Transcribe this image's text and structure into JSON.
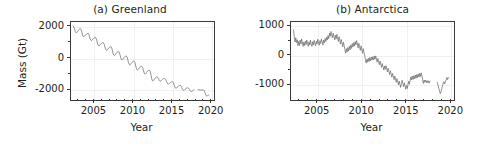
{
  "figure": {
    "background_color": "#ffffff",
    "line_color": "#6e6e6e",
    "frame_color": "#3a3a3a",
    "grid_color": "#f0f0f2"
  },
  "chart_data": [
    {
      "type": "line",
      "title": "(a) Greenland",
      "xlabel": "Year",
      "ylabel": "Mass (Gt)",
      "xlim": [
        2002.0,
        2020.3
      ],
      "ylim": [
        -2600,
        2300
      ],
      "xticks": [
        2005,
        2010,
        2015,
        2020
      ],
      "xtick_labels": [
        "2005",
        "2010",
        "2015",
        "2020"
      ],
      "xticks_minor": [
        2003,
        2004,
        2006,
        2007,
        2008,
        2009,
        2011,
        2012,
        2013,
        2014,
        2016,
        2017,
        2018,
        2019
      ],
      "yticks": [
        2000,
        0,
        -2000
      ],
      "ytick_labels": [
        "2000",
        "0",
        "-2000"
      ],
      "yticks_minor": [
        1000,
        -1000
      ],
      "grid": true,
      "legend": "none",
      "series": [
        {
          "name": "Greenland ice mass anomaly",
          "x": [
            2002.29,
            2002.46,
            2002.54,
            2002.63,
            2002.71,
            2002.79,
            2002.88,
            2002.96,
            2003.04,
            2003.13,
            2003.21,
            2003.29,
            2003.38,
            2003.46,
            2003.54,
            2003.63,
            2003.71,
            2003.79,
            2003.88,
            2003.96,
            2004.04,
            2004.13,
            2004.21,
            2004.29,
            2004.38,
            2004.46,
            2004.54,
            2004.63,
            2004.71,
            2004.79,
            2004.88,
            2004.96,
            2005.04,
            2005.13,
            2005.21,
            2005.29,
            2005.38,
            2005.46,
            2005.54,
            2005.63,
            2005.71,
            2005.79,
            2005.88,
            2005.96,
            2006.04,
            2006.13,
            2006.21,
            2006.29,
            2006.38,
            2006.46,
            2006.54,
            2006.63,
            2006.71,
            2006.79,
            2006.88,
            2006.96,
            2007.04,
            2007.13,
            2007.21,
            2007.29,
            2007.38,
            2007.46,
            2007.54,
            2007.63,
            2007.71,
            2007.79,
            2007.88,
            2007.96,
            2008.04,
            2008.13,
            2008.21,
            2008.29,
            2008.38,
            2008.46,
            2008.54,
            2008.63,
            2008.71,
            2008.79,
            2008.88,
            2008.96,
            2009.04,
            2009.13,
            2009.21,
            2009.29,
            2009.38,
            2009.46,
            2009.54,
            2009.63,
            2009.71,
            2009.79,
            2009.88,
            2009.96,
            2010.04,
            2010.13,
            2010.21,
            2010.29,
            2010.38,
            2010.46,
            2010.54,
            2010.63,
            2010.71,
            2010.79,
            2010.88,
            2010.96,
            2011.04,
            2011.13,
            2011.21,
            2011.29,
            2011.38,
            2011.46,
            2011.54,
            2011.63,
            2011.71,
            2011.79,
            2011.88,
            2011.96,
            2012.04,
            2012.13,
            2012.21,
            2012.29,
            2012.38,
            2012.46,
            2012.54,
            2012.63,
            2012.71,
            2012.79,
            2012.88,
            2012.96,
            2013.04,
            2013.13,
            2013.21,
            2013.29,
            2013.38,
            2013.46,
            2013.54,
            2013.63,
            2013.71,
            2013.79,
            2013.88,
            2013.96,
            2014.04,
            2014.13,
            2014.21,
            2014.29,
            2014.38,
            2014.46,
            2014.54,
            2014.63,
            2014.71,
            2014.79,
            2014.88,
            2014.96,
            2015.04,
            2015.13,
            2015.21,
            2015.29,
            2015.38,
            2015.46,
            2015.54,
            2015.63,
            2015.71,
            2015.79,
            2015.88,
            2015.96,
            2016.04,
            2016.13,
            2016.21,
            2016.29,
            2016.38,
            2016.46,
            2016.54,
            2016.63,
            2016.71,
            2016.79,
            2016.88,
            2016.96,
            2017.04,
            2017.13,
            2017.21,
            2017.29,
            2017.38,
            2017.46,
            2017.54,
            2017.63,
            2017.71,
            2017.79,
            2017.88,
            2017.96,
            2018.5,
            2018.63,
            2018.71,
            2018.79,
            2018.88,
            2018.96,
            2019.04,
            2019.13,
            2019.21,
            2019.29,
            2019.38,
            2019.46,
            2019.54,
            2019.63,
            2019.71,
            2019.79,
            2019.88
          ],
          "y": [
            2050,
            1860,
            1700,
            1620,
            1600,
            1640,
            1700,
            1760,
            1800,
            1860,
            1880,
            1840,
            1700,
            1520,
            1400,
            1350,
            1370,
            1420,
            1470,
            1500,
            1520,
            1560,
            1580,
            1520,
            1400,
            1250,
            1140,
            1100,
            1120,
            1170,
            1220,
            1260,
            1280,
            1300,
            1290,
            1200,
            1040,
            880,
            790,
            760,
            790,
            840,
            890,
            930,
            960,
            980,
            960,
            880,
            740,
            590,
            500,
            470,
            500,
            550,
            610,
            660,
            690,
            710,
            700,
            610,
            440,
            270,
            170,
            140,
            170,
            230,
            290,
            340,
            370,
            390,
            380,
            300,
            150,
            -10,
            -110,
            -140,
            -110,
            -50,
            10,
            60,
            90,
            110,
            100,
            20,
            -140,
            -320,
            -430,
            -470,
            -440,
            -380,
            -320,
            -270,
            -240,
            -220,
            -230,
            -310,
            -470,
            -650,
            -760,
            -800,
            -770,
            -710,
            -650,
            -600,
            -570,
            -550,
            -560,
            -630,
            -770,
            -930,
            -1030,
            -1060,
            -1030,
            -970,
            -910,
            -860,
            -830,
            -810,
            -820,
            -910,
            -1100,
            -1330,
            -1470,
            -1510,
            -1470,
            -1400,
            -1340,
            -1290,
            -1260,
            -1240,
            -1250,
            -1300,
            -1390,
            -1470,
            -1510,
            -1510,
            -1480,
            -1440,
            -1400,
            -1370,
            -1350,
            -1340,
            -1350,
            -1400,
            -1490,
            -1600,
            -1680,
            -1710,
            -1690,
            -1650,
            -1610,
            -1580,
            -1560,
            -1550,
            -1560,
            -1620,
            -1740,
            -1870,
            -1950,
            -1980,
            -1950,
            -1900,
            -1850,
            -1810,
            -1790,
            -1780,
            -1790,
            -1840,
            -1930,
            -2020,
            -2080,
            -2100,
            -2080,
            -2040,
            -2000,
            -1970,
            -1950,
            -1940,
            -1950,
            -1990,
            -2060,
            -2120,
            -2160,
            -2170,
            -2150,
            -2120,
            -2090,
            -2070,
            -2060,
            -2070,
            -2080,
            -2090,
            -2090,
            -2080,
            -2070,
            -2070,
            -2080,
            -2130,
            -2250,
            -2380,
            -2450,
            -2470,
            -2450,
            -2420,
            -2400
          ]
        }
      ]
    },
    {
      "type": "line",
      "title": "(b) Antarctica",
      "xlabel": "Year",
      "ylabel": "",
      "xlim": [
        2002.0,
        2020.3
      ],
      "ylim": [
        -1500,
        1150
      ],
      "xticks": [
        2005,
        2010,
        2015,
        2020
      ],
      "xtick_labels": [
        "2005",
        "2010",
        "2015",
        "2020"
      ],
      "xticks_minor": [
        2003,
        2004,
        2006,
        2007,
        2008,
        2009,
        2011,
        2012,
        2013,
        2014,
        2016,
        2017,
        2018,
        2019
      ],
      "yticks": [
        1000,
        0,
        -1000
      ],
      "ytick_labels": [
        "1000",
        "0",
        "-1000"
      ],
      "yticks_minor": [
        500,
        -500
      ],
      "grid": true,
      "legend": "none",
      "series": [
        {
          "name": "Antarctica ice mass anomaly",
          "x": [
            2002.29,
            2002.38,
            2002.46,
            2002.54,
            2002.63,
            2002.71,
            2002.79,
            2002.88,
            2002.96,
            2003.04,
            2003.13,
            2003.21,
            2003.29,
            2003.38,
            2003.46,
            2003.54,
            2003.63,
            2003.71,
            2003.79,
            2003.88,
            2003.96,
            2004.04,
            2004.13,
            2004.21,
            2004.29,
            2004.38,
            2004.46,
            2004.54,
            2004.63,
            2004.71,
            2004.79,
            2004.88,
            2004.96,
            2005.04,
            2005.13,
            2005.21,
            2005.29,
            2005.38,
            2005.46,
            2005.54,
            2005.63,
            2005.71,
            2005.79,
            2005.88,
            2005.96,
            2006.04,
            2006.13,
            2006.21,
            2006.29,
            2006.38,
            2006.46,
            2006.54,
            2006.63,
            2006.71,
            2006.79,
            2006.88,
            2006.96,
            2007.04,
            2007.13,
            2007.21,
            2007.29,
            2007.38,
            2007.46,
            2007.54,
            2007.63,
            2007.71,
            2007.79,
            2007.88,
            2007.96,
            2008.04,
            2008.13,
            2008.21,
            2008.29,
            2008.38,
            2008.46,
            2008.54,
            2008.63,
            2008.71,
            2008.79,
            2008.88,
            2008.96,
            2009.04,
            2009.13,
            2009.21,
            2009.29,
            2009.38,
            2009.46,
            2009.54,
            2009.63,
            2009.71,
            2009.79,
            2009.88,
            2009.96,
            2010.04,
            2010.13,
            2010.21,
            2010.29,
            2010.38,
            2010.46,
            2010.54,
            2010.63,
            2010.71,
            2010.79,
            2010.88,
            2010.96,
            2011.04,
            2011.13,
            2011.21,
            2011.29,
            2011.38,
            2011.46,
            2011.54,
            2011.63,
            2011.71,
            2011.79,
            2011.88,
            2011.96,
            2012.04,
            2012.13,
            2012.21,
            2012.29,
            2012.38,
            2012.46,
            2012.54,
            2012.63,
            2012.71,
            2012.79,
            2012.88,
            2012.96,
            2013.04,
            2013.13,
            2013.21,
            2013.29,
            2013.38,
            2013.46,
            2013.54,
            2013.63,
            2013.71,
            2013.79,
            2013.88,
            2013.96,
            2014.04,
            2014.13,
            2014.21,
            2014.29,
            2014.38,
            2014.46,
            2014.54,
            2014.63,
            2014.71,
            2014.79,
            2014.88,
            2014.96,
            2015.04,
            2015.13,
            2015.21,
            2015.29,
            2015.38,
            2015.46,
            2015.54,
            2015.63,
            2015.71,
            2015.79,
            2015.88,
            2015.96,
            2016.04,
            2016.13,
            2016.21,
            2016.29,
            2016.38,
            2016.46,
            2016.54,
            2016.63,
            2016.71,
            2016.79,
            2016.88,
            2016.96,
            2017.04,
            2017.13,
            2017.21,
            2017.29,
            2017.38,
            2017.46,
            2017.54,
            2017.63,
            2017.71,
            2017.79,
            2018.63,
            2018.71,
            2018.79,
            2018.88,
            2018.96,
            2019.04,
            2019.13,
            2019.21,
            2019.29,
            2019.38,
            2019.46,
            2019.54,
            2019.63,
            2019.71,
            2019.79,
            2019.88
          ],
          "y": [
            880,
            620,
            450,
            600,
            430,
            530,
            330,
            470,
            330,
            520,
            380,
            560,
            420,
            300,
            450,
            330,
            480,
            360,
            520,
            400,
            300,
            460,
            350,
            520,
            380,
            300,
            460,
            350,
            510,
            400,
            320,
            480,
            380,
            550,
            430,
            340,
            500,
            400,
            560,
            450,
            350,
            520,
            420,
            580,
            470,
            620,
            520,
            680,
            570,
            760,
            650,
            820,
            700,
            600,
            760,
            640,
            520,
            690,
            560,
            720,
            600,
            470,
            640,
            520,
            380,
            540,
            420,
            290,
            450,
            330,
            180,
            60,
            220,
            100,
            260,
            140,
            300,
            180,
            350,
            230,
            400,
            280,
            430,
            310,
            470,
            350,
            500,
            380,
            250,
            410,
            290,
            160,
            320,
            200,
            60,
            220,
            100,
            -40,
            -160,
            -280,
            -140,
            -250,
            -110,
            -230,
            -90,
            -200,
            -70,
            -180,
            -60,
            -170,
            -40,
            -150,
            -30,
            -140,
            -250,
            -120,
            -230,
            -340,
            -210,
            -320,
            -430,
            -300,
            -410,
            -520,
            -390,
            -500,
            -370,
            -480,
            -590,
            -460,
            -570,
            -680,
            -550,
            -660,
            -770,
            -640,
            -750,
            -860,
            -730,
            -840,
            -950,
            -820,
            -930,
            -1040,
            -910,
            -1020,
            -1130,
            -1000,
            -880,
            -990,
            -1100,
            -970,
            -1080,
            -1190,
            -1060,
            -1170,
            -1040,
            -910,
            -1020,
            -890,
            -760,
            -870,
            -740,
            -850,
            -720,
            -830,
            -700,
            -810,
            -680,
            -790,
            -660,
            -770,
            -640,
            -750,
            -620,
            -730,
            -860,
            -990,
            -870,
            -950,
            -880,
            -960,
            -890,
            -970,
            -900,
            -980,
            -910,
            -950,
            -1050,
            -1150,
            -1260,
            -1340,
            -1280,
            -1180,
            -1080,
            -1000,
            -930,
            -1010,
            -930,
            -860,
            -780,
            -860,
            -790
          ]
        }
      ]
    }
  ]
}
